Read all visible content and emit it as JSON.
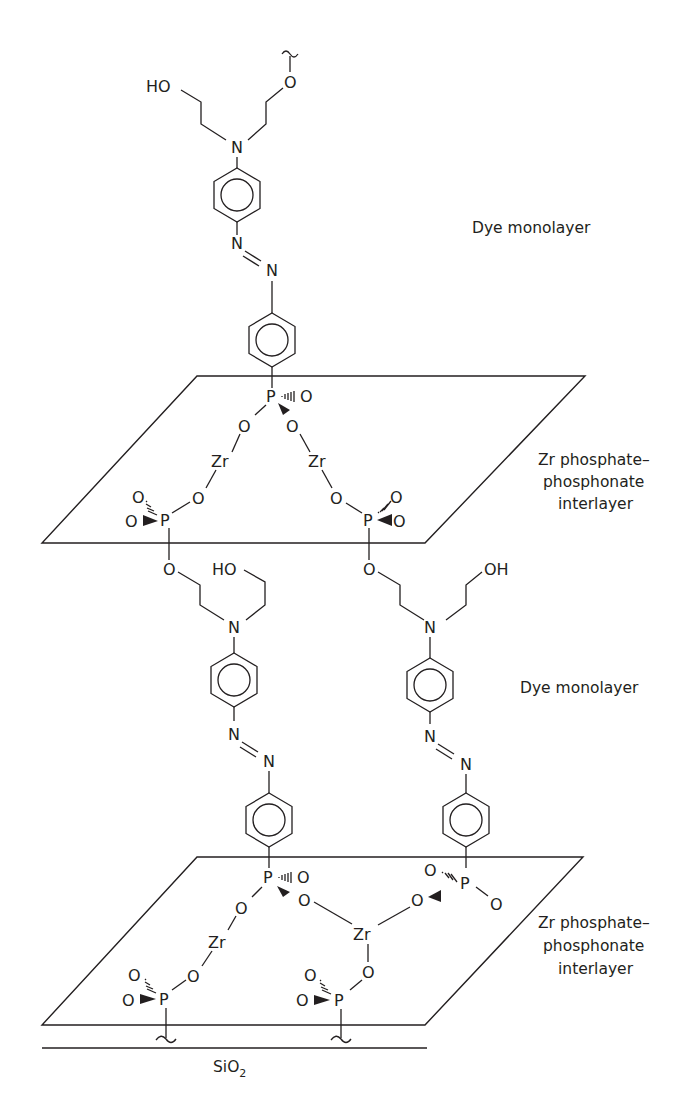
{
  "diagram": {
    "type": "layered-chemical-structure",
    "labels": {
      "dye_monolayer_top": "Dye monolayer",
      "interlayer_top_line1": "Zr phosphate–",
      "interlayer_top_line2": "phosphonate",
      "interlayer_top_line3": "interlayer",
      "dye_monolayer_mid": "Dye monolayer",
      "interlayer_bottom_line1": "Zr phosphate–",
      "interlayer_bottom_line2": "phosphonate",
      "interlayer_bottom_line3": "interlayer",
      "substrate": "SiO",
      "substrate_sub": "2"
    },
    "atoms": {
      "HO": "HO",
      "OH": "OH",
      "O": "O",
      "N": "N",
      "P": "P",
      "Zr": "Zr"
    },
    "layers": [
      {
        "name": "Dye monolayer",
        "chains": 1
      },
      {
        "name": "Zr phosphate–phosphonate interlayer",
        "zr_count": 2
      },
      {
        "name": "Dye monolayer",
        "chains": 2
      },
      {
        "name": "Zr phosphate–phosphonate interlayer",
        "zr_count": 2
      },
      {
        "name": "SiO2 substrate"
      }
    ]
  }
}
